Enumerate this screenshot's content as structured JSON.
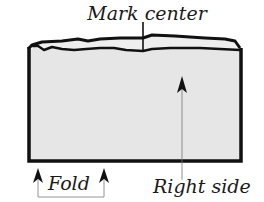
{
  "diagram": {
    "type": "fabric-folding-instruction",
    "labels": {
      "mark_center": "Mark center",
      "fold": "Fold",
      "right_side": "Right side"
    },
    "colors": {
      "fabric_fill": "#e6e6e6",
      "outline": "#111111",
      "leader_line": "#666666",
      "background": "#ffffff"
    }
  }
}
